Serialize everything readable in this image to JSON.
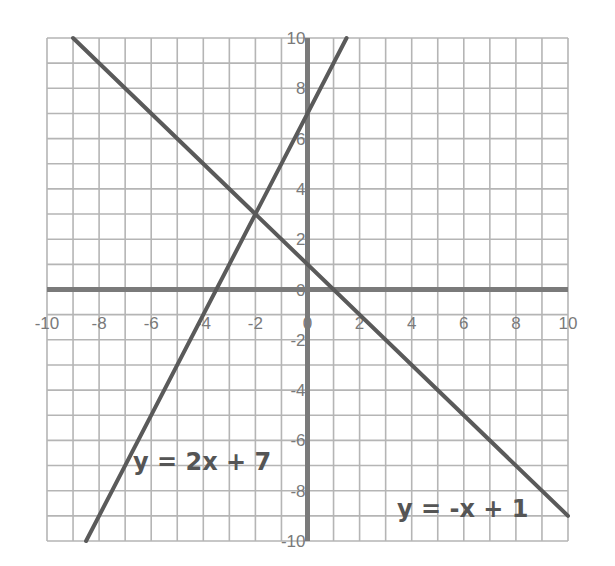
{
  "chart_data": {
    "type": "line",
    "title": "",
    "xlabel": "",
    "ylabel": "",
    "xlim": [
      -10,
      10
    ],
    "ylim": [
      -10,
      10
    ],
    "grid": true,
    "grid_step": 1,
    "x_ticks": [
      -10,
      -8,
      -6,
      -4,
      -2,
      0,
      2,
      4,
      6,
      8,
      10
    ],
    "y_ticks": [
      10,
      8,
      6,
      4,
      2,
      0,
      -2,
      -4,
      -6,
      -8,
      -10
    ],
    "series": [
      {
        "name": "y = -x + 1",
        "slope": -1,
        "intercept": 1,
        "points": [
          [
            -9,
            10
          ],
          [
            10,
            -9
          ]
        ]
      },
      {
        "name": "y = 2x + 7",
        "slope": 2,
        "intercept": 7,
        "points": [
          [
            -8.5,
            -10
          ],
          [
            1.5,
            10
          ]
        ]
      }
    ],
    "intersection": [
      -2,
      3
    ],
    "annotations": [
      {
        "text": "y = 2x + 7",
        "x": -6.8,
        "y": -6.9
      },
      {
        "text": "y = -x + 1",
        "x": 3.3,
        "y": -8.8
      }
    ],
    "legend": "none"
  },
  "labels": {
    "line1": "y = 2x + 7",
    "line2": "y = -x + 1"
  },
  "colors": {
    "grid": "#b5b5b5",
    "axis": "#7a7a7a",
    "line": "#5a5a5a",
    "text": "#555555"
  }
}
